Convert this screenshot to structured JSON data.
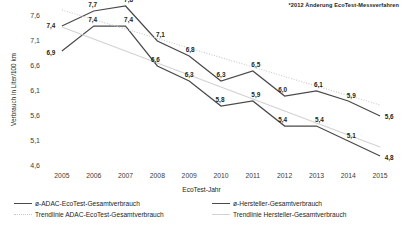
{
  "annotation": "*2012 Änderung EcoTest-Messverfahren",
  "axes": {
    "y_title": "Verbrauch in Liter/100 km",
    "x_title": "EcoTest-Jahr",
    "y_ticks": [
      "7,6",
      "7,1",
      "6,6",
      "6,1",
      "5,6",
      "5,1",
      "4,6"
    ],
    "x_ticks": [
      "2005",
      "2006",
      "2007",
      "2008",
      "2009",
      "2010",
      "2011",
      "2012",
      "2013",
      "2014",
      "2015"
    ]
  },
  "legend": {
    "items": [
      {
        "label": "ø-ADAC-EcoTest-Gesamtverbrauch",
        "style": "solid",
        "color": "#4a4a4a"
      },
      {
        "label": "ø-Hersteller-Gesamtverbrauch",
        "style": "solid",
        "color": "#4a4a4a"
      },
      {
        "label": "Trendlinie ADAC-EcoTest-Gesamtverbrauch",
        "style": "dotted",
        "color": "#c9c9c9"
      },
      {
        "label": "Trendlinie Hersteller-Gesamtverbrauch",
        "style": "lightsolid",
        "color": "#d2d2d2"
      }
    ]
  },
  "chart_data": {
    "type": "line",
    "title": "",
    "xlabel": "EcoTest-Jahr",
    "ylabel": "Verbrauch in Liter/100 km",
    "categories": [
      "2005",
      "2006",
      "2007",
      "2008",
      "2009",
      "2010",
      "2011",
      "2012",
      "2013",
      "2014",
      "2015"
    ],
    "ylim": [
      4.6,
      7.85
    ],
    "yticks": [
      4.6,
      5.1,
      5.6,
      6.1,
      6.6,
      7.1,
      7.6
    ],
    "grid": false,
    "legend_position": "bottom",
    "series": [
      {
        "name": "ø-ADAC-EcoTest-Gesamtverbrauch",
        "color": "#4a4a4a",
        "style": "solid",
        "values": [
          7.4,
          7.7,
          7.8,
          7.1,
          6.8,
          6.3,
          6.5,
          6.0,
          6.1,
          5.9,
          5.6
        ],
        "labels": [
          "7,4",
          "7,7",
          "7,8",
          "7,1",
          "6,8",
          "6,3",
          "6,5",
          "6,0",
          "6,1",
          "5,9",
          "5,6"
        ]
      },
      {
        "name": "ø-Hersteller-Gesamtverbrauch",
        "color": "#4a4a4a",
        "style": "solid",
        "values": [
          6.9,
          7.4,
          7.4,
          6.6,
          6.3,
          5.8,
          5.9,
          5.4,
          5.4,
          5.1,
          4.8
        ],
        "labels": [
          "6,9",
          "7,4",
          "7,4",
          "6,6",
          "6,3",
          "5,8",
          "5,9",
          "5,4",
          "5,4",
          "5,1",
          "4,8"
        ]
      },
      {
        "name": "Trendlinie ADAC-EcoTest-Gesamtverbrauch",
        "color": "#c9c9c9",
        "style": "dotted",
        "trend": true,
        "values": [
          7.72,
          7.53,
          7.34,
          7.15,
          6.96,
          6.77,
          6.58,
          6.39,
          6.2,
          6.01,
          5.82
        ]
      },
      {
        "name": "Trendlinie Hersteller-Gesamtverbrauch",
        "color": "#d2d2d2",
        "style": "solid",
        "trend": true,
        "values": [
          7.38,
          7.14,
          6.9,
          6.66,
          6.42,
          6.18,
          5.94,
          5.7,
          5.46,
          5.22,
          4.98
        ]
      }
    ],
    "annotations": [
      "*2012 Änderung EcoTest-Messverfahren"
    ]
  }
}
